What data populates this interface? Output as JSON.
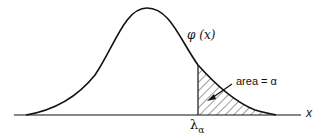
{
  "diagram": {
    "type": "normal-distribution-tail",
    "curve_label": "φ (x)",
    "area_label": "area = α",
    "x_axis_label": "x",
    "critical_value_label": {
      "symbol": "λ",
      "subscript": "α"
    },
    "shaded_region": "right tail beyond λα"
  }
}
